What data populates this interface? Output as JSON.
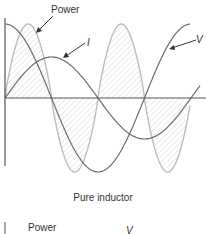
{
  "figure": {
    "caption": "Pure inductor",
    "labels": {
      "power": "Power",
      "current": "I",
      "voltage": "V"
    },
    "next_figure": {
      "power_label": "Power",
      "voltage_label": "V"
    },
    "colors": {
      "axis": "#555555",
      "voltage": "#666666",
      "current": "#666666",
      "power": "#bdbdbd",
      "hatch": "#d9d9d9",
      "text": "#333333"
    }
  },
  "chart_data": {
    "type": "line",
    "title": "Pure inductor",
    "xlabel": "",
    "ylabel": "",
    "x": [
      0,
      45,
      90,
      135,
      180,
      225,
      270,
      315,
      360
    ],
    "series": [
      {
        "name": "V",
        "values": [
          1,
          0.71,
          0,
          -0.71,
          -1,
          -0.71,
          0,
          0.71,
          1
        ]
      },
      {
        "name": "I",
        "values": [
          0,
          0.39,
          0.55,
          0.39,
          0,
          -0.39,
          -0.55,
          -0.39,
          0
        ]
      },
      {
        "name": "Power",
        "values": [
          0,
          1,
          0,
          -1,
          0,
          1,
          0,
          -1,
          0
        ]
      }
    ],
    "annotations": [
      "Power",
      "I",
      "V"
    ],
    "grid": false,
    "legend": "none (arrow labels)"
  }
}
